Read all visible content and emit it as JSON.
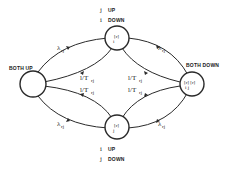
{
  "diagram": {
    "nodes": {
      "both_up": {
        "label": "BOTH UP"
      },
      "top": {
        "inner_top": "[r]",
        "inner_bottom": "i",
        "caption_line1_var": "j",
        "caption_line1_text": "UP",
        "caption_line2_var": "i",
        "caption_line2_text": "DOWN"
      },
      "bottom": {
        "inner_top": "[r]",
        "inner_bottom": "j",
        "caption_line1_var": "i",
        "caption_line1_text": "UP",
        "caption_line2_var": "j",
        "caption_line2_text": "DOWN"
      },
      "both_down": {
        "label": "BOTH DOWN",
        "inner_top": "[r] [r]",
        "inner_bottom": "i    j"
      }
    },
    "edges": {
      "up_to_top": "λ",
      "up_to_top_sub": "rj",
      "top_to_up": "l/T",
      "top_to_up_sub": "rj",
      "up_to_bottom_rate": "l/T",
      "up_to_bottom_rate_sub": "rj",
      "up_to_bottom": "λ",
      "up_to_bottom_sub": "rj",
      "top_to_down": "λ",
      "top_to_down_sub": "rj",
      "down_to_top": "l/T",
      "down_to_top_sub": "rj",
      "down_to_bottom": "l/T",
      "down_to_bottom_sub": "rj",
      "bottom_to_down": "λ",
      "bottom_to_down_sub": "rj"
    }
  }
}
